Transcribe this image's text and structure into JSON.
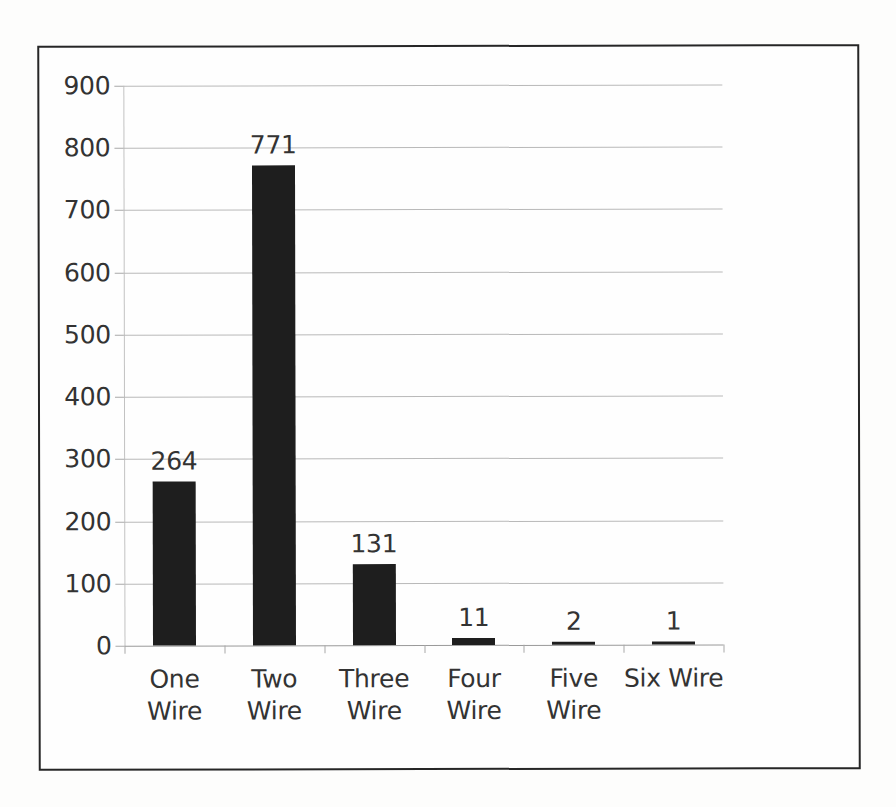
{
  "chart_data": {
    "type": "bar",
    "title": "",
    "subtitle": "",
    "xlabel": "",
    "ylabel": "",
    "categories": [
      "One Wire",
      "Two Wire",
      "Three Wire",
      "Four Wire",
      "Five Wire",
      "Six Wire"
    ],
    "values": [
      264,
      771,
      131,
      11,
      2,
      1
    ],
    "data_labels": [
      "264",
      "771",
      "131",
      "11",
      "2",
      "1"
    ],
    "ylim": [
      0,
      900
    ],
    "ytick_step": 100,
    "ytick_labels": [
      "900",
      "800",
      "700",
      "600",
      "500",
      "400",
      "300",
      "200",
      "100",
      "0"
    ],
    "ytick_values": [
      900,
      800,
      700,
      600,
      500,
      400,
      300,
      200,
      100,
      0
    ],
    "grid": true,
    "grid_axis": "y",
    "legend": false,
    "legend_position": "none",
    "colors": {
      "bar": "#1e1e1e",
      "gridline": "#b9b9b9",
      "axis": "#a8a8a8",
      "text": "#333333",
      "frame": "#262626",
      "background": "#fefefe",
      "page": "#fdfdfc"
    }
  }
}
